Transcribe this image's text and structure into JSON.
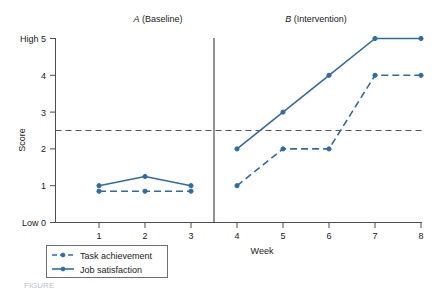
{
  "chart_data": {
    "type": "line",
    "title": "",
    "xlabel": "Week",
    "ylabel": "Score",
    "x": [
      1,
      2,
      3,
      4,
      5,
      6,
      7,
      8
    ],
    "xlim": [
      0.2,
      8.6
    ],
    "ylim": [
      0,
      5
    ],
    "ytick_values": [
      0,
      1,
      2,
      3,
      4,
      5
    ],
    "ytick_labels": [
      "Low 0",
      "1",
      "2",
      "3",
      "4",
      "High 5"
    ],
    "xtick_labels": [
      "1",
      "2",
      "3",
      "4",
      "5",
      "6",
      "7",
      "8"
    ],
    "grid": false,
    "legend_position": "below-left",
    "series": [
      {
        "name": "Task achievement",
        "style": "dashed",
        "color": "#2f6ca5",
        "values": [
          0.85,
          0.85,
          0.85,
          1,
          2,
          2,
          4,
          4
        ]
      },
      {
        "name": "Job satisfaction",
        "style": "solid",
        "color": "#2f6ca5",
        "values": [
          1,
          1.25,
          1,
          2,
          3,
          4,
          5,
          5
        ]
      }
    ],
    "phases": [
      {
        "id": "A",
        "label": "(Baseline)",
        "weeks": [
          1,
          2,
          3
        ]
      },
      {
        "id": "B",
        "label": "(Intervention)",
        "weeks": [
          4,
          5,
          6,
          7,
          8
        ]
      }
    ],
    "phase_divider_x": 3.5,
    "reference_line": {
      "value": 2.5,
      "style": "dashed",
      "color": "#55565a"
    },
    "annotations": []
  },
  "figure": {
    "phase_a_letter": "A",
    "phase_a_label": " (Baseline)",
    "phase_b_letter": "B",
    "phase_b_label": " (Intervention)",
    "y_axis_title": "Score",
    "x_axis_title": "Week",
    "y_label_top": "High 5",
    "y_label_4": "4",
    "y_label_3": "3",
    "y_label_2": "2",
    "y_label_1": "1",
    "y_label_bottom": "Low 0",
    "x_label_1": "1",
    "x_label_2": "2",
    "x_label_3": "3",
    "x_label_4": "4",
    "x_label_5": "5",
    "x_label_6": "6",
    "x_label_7": "7",
    "x_label_8": "8",
    "legend_item_1": "Task achievement",
    "legend_item_2": "Job satisfaction",
    "caption": "FIGURE"
  }
}
